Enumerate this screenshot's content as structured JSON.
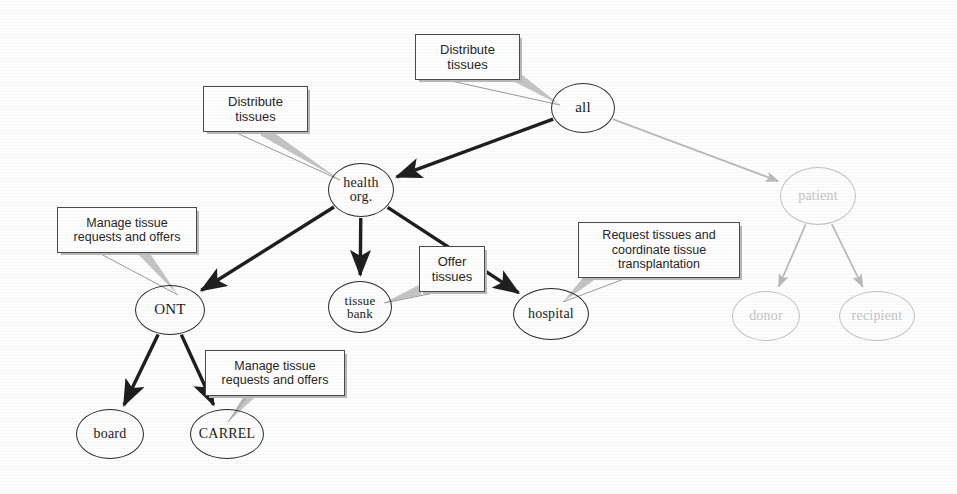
{
  "diagram": {
    "colors": {
      "node_stroke": "#2a2a2a",
      "node_text": "#1c1c1c",
      "faded_stroke": "#c2c2c2",
      "faded_text": "#c5c5c5",
      "edge_strong": "#1f1f1f",
      "edge_faded": "#b9b9b9",
      "annotation_border": "#4a4a4a",
      "annotation_text": "#262626",
      "leader_line": "#9a9a9a",
      "background": "#fdfdfd"
    },
    "nodes": [
      {
        "id": "all",
        "label": "all",
        "x": 583,
        "y": 108,
        "rx": 32,
        "ry": 25,
        "font": 15,
        "faded": false
      },
      {
        "id": "health",
        "label": "health\norg.",
        "line1": "health",
        "line2": "org.",
        "x": 361,
        "y": 190,
        "rx": 33,
        "ry": 27,
        "font": 14,
        "faded": false
      },
      {
        "id": "patient",
        "label": "patient",
        "x": 818,
        "y": 196,
        "rx": 38,
        "ry": 29,
        "font": 14,
        "faded": true
      },
      {
        "id": "ont",
        "label": "ONT",
        "x": 170,
        "y": 310,
        "rx": 35,
        "ry": 25,
        "font": 15,
        "faded": false
      },
      {
        "id": "tissuebank",
        "label": "tissue\nbank",
        "line1": "tissue",
        "line2": "bank",
        "x": 360,
        "y": 307,
        "rx": 32,
        "ry": 26,
        "font": 13,
        "faded": false
      },
      {
        "id": "hospital",
        "label": "hospital",
        "x": 551,
        "y": 314,
        "rx": 38,
        "ry": 26,
        "font": 14,
        "faded": false
      },
      {
        "id": "donor",
        "label": "donor",
        "x": 766,
        "y": 316,
        "rx": 34,
        "ry": 25,
        "font": 14,
        "faded": true
      },
      {
        "id": "recipient",
        "label": "recipient",
        "x": 877,
        "y": 316,
        "rx": 38,
        "ry": 25,
        "font": 14,
        "faded": true
      },
      {
        "id": "board",
        "label": "board",
        "x": 110,
        "y": 434,
        "rx": 34,
        "ry": 25,
        "font": 14,
        "faded": false
      },
      {
        "id": "carrel",
        "label": "CARREL",
        "x": 227,
        "y": 434,
        "rx": 37,
        "ry": 25,
        "font": 14,
        "faded": false
      }
    ],
    "edges": [
      {
        "from": "all",
        "to": "health",
        "style": "strong"
      },
      {
        "from": "all",
        "to": "patient",
        "style": "faded"
      },
      {
        "from": "health",
        "to": "ont",
        "style": "strong"
      },
      {
        "from": "health",
        "to": "tissuebank",
        "style": "strong"
      },
      {
        "from": "health",
        "to": "hospital",
        "style": "strong"
      },
      {
        "from": "ont",
        "to": "board",
        "style": "strong"
      },
      {
        "from": "ont",
        "to": "carrel",
        "style": "strong"
      },
      {
        "from": "patient",
        "to": "donor",
        "style": "faded"
      },
      {
        "from": "patient",
        "to": "recipient",
        "style": "faded"
      }
    ],
    "annotations": [
      {
        "id": "annot-all",
        "text": "Distribute tissues",
        "line1": "Distribute",
        "line2": "tissues",
        "target": "all",
        "x": 415,
        "y": 34,
        "w": 105,
        "h": 46,
        "font": 13,
        "tail_from_x": 518,
        "tail_from_y": 78,
        "tail_to_x": 560,
        "tail_to_y": 105
      },
      {
        "id": "annot-health",
        "text": "Distribute tissues",
        "line1": "Distribute",
        "line2": "tissues",
        "target": "health",
        "x": 203,
        "y": 86,
        "w": 105,
        "h": 46,
        "font": 13,
        "tail_from_x": 263,
        "tail_from_y": 131,
        "tail_to_x": 340,
        "tail_to_y": 180
      },
      {
        "id": "annot-ont",
        "text": "Manage tissue requests and offers",
        "line1": "Manage tissue",
        "line2": "requests and offers",
        "target": "ont",
        "x": 57,
        "y": 207,
        "w": 140,
        "h": 46,
        "font": 12.5,
        "tail_from_x": 143,
        "tail_from_y": 252,
        "tail_to_x": 178,
        "tail_to_y": 295
      },
      {
        "id": "annot-tissuebank",
        "text": "Offer tissues",
        "line1": "Offer",
        "line2": "tissues",
        "target": "tissuebank",
        "x": 419,
        "y": 246,
        "w": 66,
        "h": 46,
        "font": 13,
        "tail_from_x": 420,
        "tail_from_y": 290,
        "tail_to_x": 384,
        "tail_to_y": 303
      },
      {
        "id": "annot-hospital",
        "text": "Request tissues and coordinate tissue transplantation",
        "line1": "Request tissues and",
        "line2": "coordinate tissue",
        "line3": "transplantation",
        "target": "hospital",
        "x": 578,
        "y": 222,
        "w": 162,
        "h": 56,
        "font": 12.5,
        "tail_from_x": 590,
        "tail_from_y": 277,
        "tail_to_x": 563,
        "tail_to_y": 302
      },
      {
        "id": "annot-carrel",
        "text": "Manage tissue requests and offers",
        "line1": "Manage tissue",
        "line2": "requests and offers",
        "target": "carrel",
        "x": 205,
        "y": 350,
        "w": 140,
        "h": 46,
        "font": 12.5,
        "tail_from_x": 250,
        "tail_from_y": 395,
        "tail_to_x": 228,
        "tail_to_y": 422
      }
    ]
  }
}
